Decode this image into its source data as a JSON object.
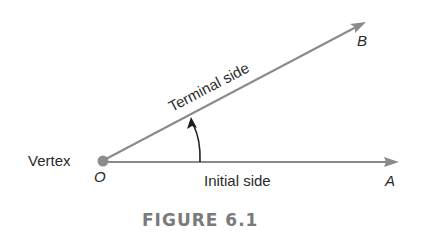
{
  "figure": {
    "caption": "FIGURE 6.1",
    "labels": {
      "vertex": "Vertex",
      "vertex_point": "O",
      "initial_side": "Initial side",
      "initial_point": "A",
      "terminal_side": "Terminal side",
      "terminal_point": "B"
    },
    "colors": {
      "ray": "#8a8a8a",
      "vertex_dot": "#8c8c8c",
      "arc": "#1e1e1e",
      "text": "#2a2a2a",
      "caption": "#7a7a7a"
    }
  }
}
